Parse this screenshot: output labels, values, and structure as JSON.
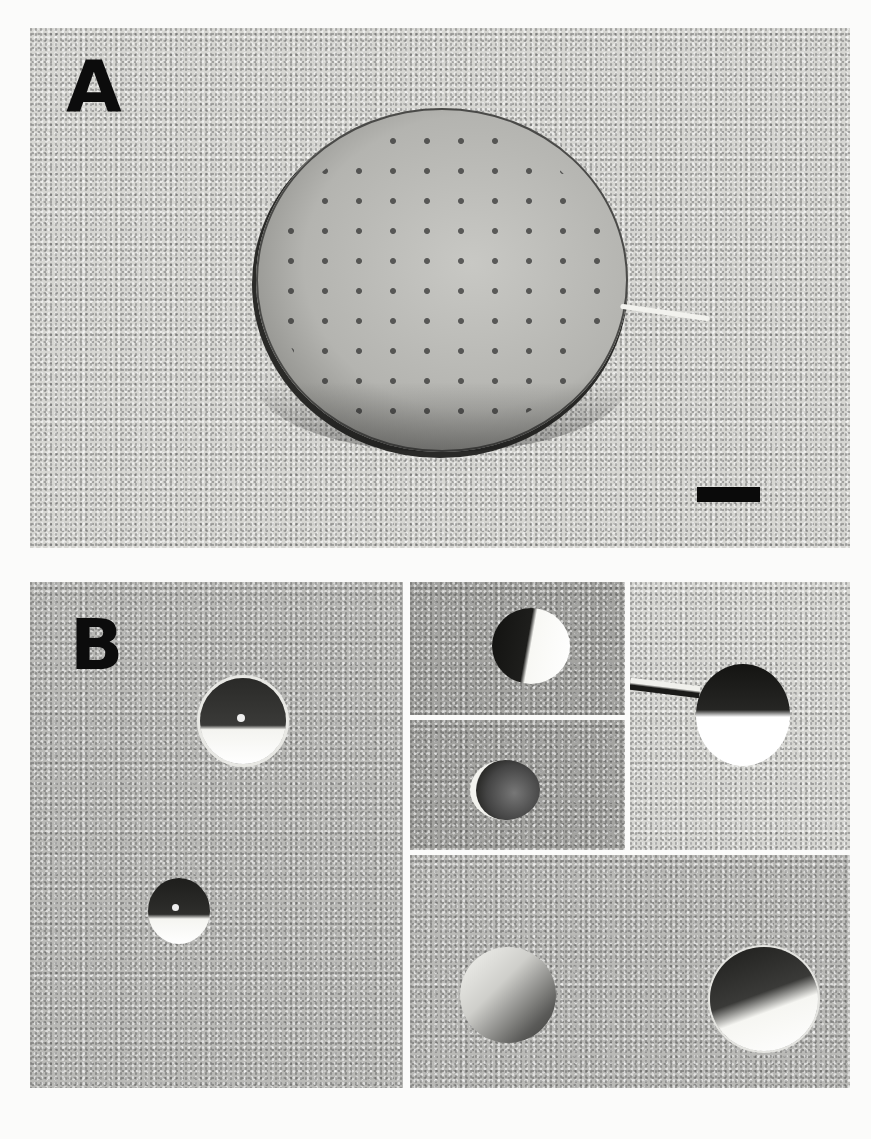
{
  "figure": {
    "panels": [
      {
        "id": "A",
        "label": "A",
        "description": "Freeze-fracture micrograph of a large spherical vesicle with intramembrane particles",
        "scale_bar": true
      },
      {
        "id": "B",
        "label": "B",
        "description": "Freeze-fracture micrographs of small vesicles (montage of 5 sub-panels)",
        "subpanels": [
          "B-main",
          "B-top-middle",
          "B-middle-middle",
          "B-top-right",
          "B-bottom-wide"
        ]
      }
    ],
    "caption_visible": "(caption text cropped at bottom edge)"
  }
}
